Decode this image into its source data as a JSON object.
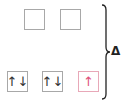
{
  "diagram": {
    "type": "crystal-field-splitting",
    "upper_level": {
      "orbitals": [
        {
          "electrons": ""
        },
        {
          "electrons": ""
        }
      ]
    },
    "lower_level": {
      "orbitals": [
        {
          "electrons": "↑↓",
          "up": "↑",
          "down": "↓"
        },
        {
          "electrons": "↑↓",
          "up": "↑",
          "down": "↓"
        },
        {
          "electrons": "↑",
          "up": "↑",
          "down": ""
        }
      ]
    },
    "splitting_label": "Δ",
    "colors": {
      "box_border": "#a8a8a8",
      "arrow": "#333333",
      "unpaired_arrow": "#e0507a"
    }
  }
}
